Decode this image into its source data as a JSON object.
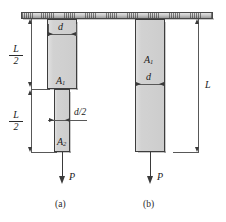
{
  "figure": {
    "support_label": "fixed-support-hatching",
    "panels": [
      {
        "id": "a",
        "caption": "(a)",
        "bars": [
          {
            "area_label": "A",
            "area_sub": "1",
            "width_label": "d"
          },
          {
            "area_label": "A",
            "area_sub": "2",
            "width_label": "d/2"
          }
        ],
        "length_dimensions": [
          {
            "numerator": "L",
            "denominator": "2"
          },
          {
            "numerator": "L",
            "denominator": "2"
          }
        ],
        "force_label": "P"
      },
      {
        "id": "b",
        "caption": "(b)",
        "bars": [
          {
            "area_label": "A",
            "area_sub": "1",
            "width_label": "d"
          }
        ],
        "length_dimensions": [
          {
            "label": "L"
          }
        ],
        "force_label": "P"
      }
    ],
    "colors": {
      "bar_fill": "#d2d2d2",
      "bar_border": "#3d3d3d",
      "line": "#585858",
      "support_fill": "#c9c9c9",
      "background": "#ffffff"
    }
  }
}
